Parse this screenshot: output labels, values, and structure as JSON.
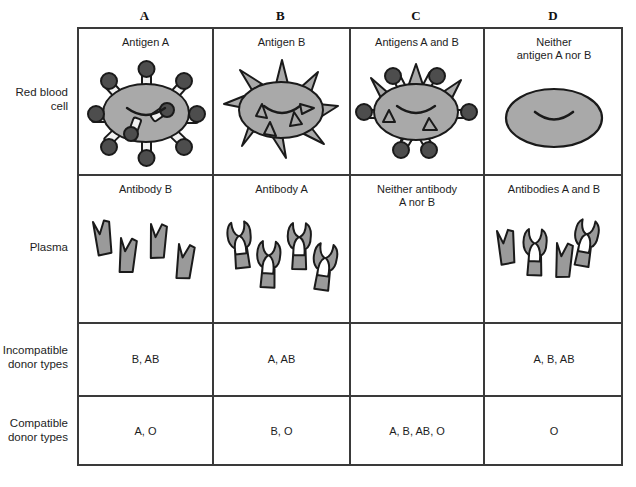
{
  "figure": {
    "colors": {
      "cell_fill": "#a9a9a9",
      "antigen_fill": "#4d4d4d",
      "antibody_fill": "#9a9a9a",
      "outline": "#1a1a1a",
      "grid_line": "#3a3a3a",
      "background": "#ffffff"
    }
  },
  "columns": [
    {
      "key": "A",
      "header": "A"
    },
    {
      "key": "B",
      "header": "B"
    },
    {
      "key": "C",
      "header": "C"
    },
    {
      "key": "D",
      "header": "D"
    }
  ],
  "rows": [
    {
      "key": "rbc",
      "label": "Red blood\ncell"
    },
    {
      "key": "plasma",
      "label": "Plasma"
    },
    {
      "key": "incompatible",
      "label": "Incompatible\ndonor types"
    },
    {
      "key": "compatible",
      "label": "Compatible\ndonor types"
    }
  ],
  "cells": {
    "rbc": [
      {
        "caption": "Antigen A",
        "art": "rbc-antigen-a",
        "antigen_a": 8,
        "antigen_b": 0
      },
      {
        "caption": "Antigen B",
        "art": "rbc-antigen-b",
        "antigen_a": 0,
        "antigen_b": 9
      },
      {
        "caption": "Antigens A and B",
        "art": "rbc-antigen-ab",
        "antigen_a": 6,
        "antigen_b": 6
      },
      {
        "caption": "Neither\nantigen A nor B",
        "art": "rbc-antigen-none",
        "antigen_a": 0,
        "antigen_b": 0
      }
    ],
    "plasma": [
      {
        "caption": "Antibody B",
        "art": "antibody-b",
        "antibody_a": 0,
        "antibody_b": 4
      },
      {
        "caption": "Antibody A",
        "art": "antibody-a",
        "antibody_a": 4,
        "antibody_b": 0
      },
      {
        "caption": "Neither antibody\nA nor B",
        "art": "antibody-none",
        "antibody_a": 0,
        "antibody_b": 0
      },
      {
        "caption": "Antibodies A and B",
        "art": "antibody-ab",
        "antibody_a": 2,
        "antibody_b": 2
      }
    ],
    "incompatible": [
      {
        "value": "B, AB"
      },
      {
        "value": "A, AB"
      },
      {
        "value": ""
      },
      {
        "value": "A, B, AB"
      }
    ],
    "compatible": [
      {
        "value": "A, O"
      },
      {
        "value": "B, O"
      },
      {
        "value": "A, B, AB, O"
      },
      {
        "value": "O"
      }
    ]
  }
}
